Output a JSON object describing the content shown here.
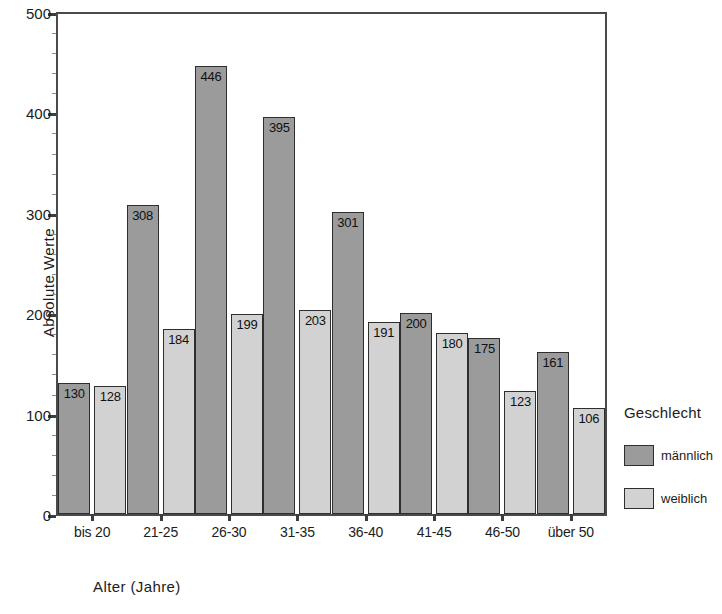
{
  "chart_data": {
    "type": "bar",
    "title": "",
    "xlabel": "Alter (Jahre)",
    "ylabel": "Absolute Werte",
    "ylim": [
      0,
      500
    ],
    "yticks": [
      0,
      100,
      200,
      300,
      400,
      500
    ],
    "grid": false,
    "legend_position": "right",
    "legend_title": "Geschlecht",
    "categories": [
      "bis 20",
      "21-25",
      "26-30",
      "31-35",
      "36-40",
      "41-45",
      "46-50",
      "über 50"
    ],
    "series": [
      {
        "name": "männlich",
        "color": "#9b9b9b",
        "values": [
          130,
          308,
          446,
          395,
          301,
          200,
          175,
          161
        ]
      },
      {
        "name": "weiblich",
        "color": "#d2d2d2",
        "values": [
          128,
          184,
          199,
          203,
          191,
          180,
          123,
          106
        ]
      }
    ]
  },
  "axes": {
    "y_title": "Absolute Werte",
    "x_title": "Alter (Jahre)",
    "y_tick_labels": [
      "500",
      "400",
      "300",
      "200",
      "100",
      "0"
    ],
    "x_tick_labels": [
      "bis 20",
      "21-25",
      "26-30",
      "31-35",
      "36-40",
      "41-45",
      "46-50",
      "über 50"
    ]
  },
  "legend": {
    "title": "Geschlecht",
    "entries": [
      {
        "label": "männlich",
        "color": "#9b9b9b"
      },
      {
        "label": "weiblich",
        "color": "#d2d2d2"
      }
    ]
  },
  "bar_labels": {
    "male": [
      "130",
      "308",
      "446",
      "395",
      "301",
      "200",
      "175",
      "161"
    ],
    "female": [
      "128",
      "184",
      "199",
      "203",
      "191",
      "180",
      "123",
      "106"
    ]
  }
}
